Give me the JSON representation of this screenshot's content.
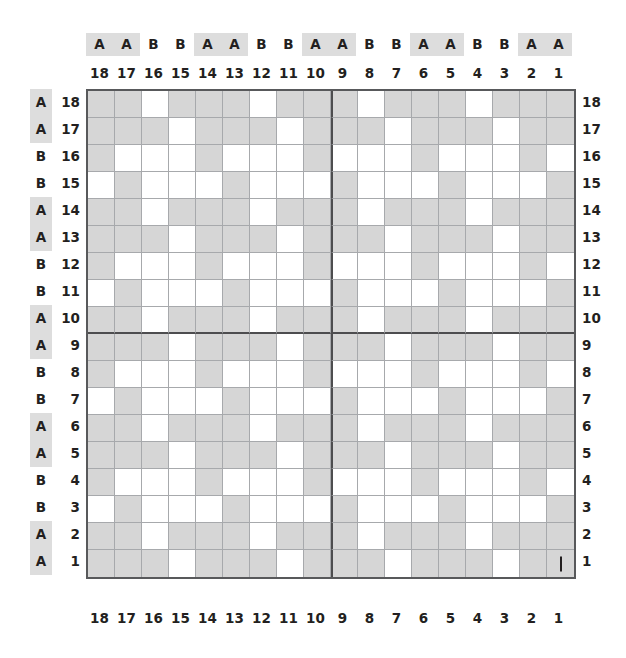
{
  "legend": {
    "shade_color": "#d6d6d6",
    "empty_color": "#ffffff",
    "highlight_color": "#dddddd",
    "grid_line_color": "#a7a9ac",
    "repeat_line_color": "#4d4d4f"
  },
  "chart_data": {
    "type": "heatmap",
    "title": "",
    "subtitle": "",
    "xlabel": "",
    "ylabel": "",
    "grid": true,
    "legend_position": "none",
    "rows": 18,
    "cols": 18,
    "x_tick_labels_top": [
      "18",
      "17",
      "16",
      "15",
      "14",
      "13",
      "12",
      "11",
      "10",
      "9",
      "8",
      "7",
      "6",
      "5",
      "4",
      "3",
      "2",
      "1"
    ],
    "x_tick_labels_bottom": [
      "18",
      "17",
      "16",
      "15",
      "14",
      "13",
      "12",
      "11",
      "10",
      "9",
      "8",
      "7",
      "6",
      "5",
      "4",
      "3",
      "2",
      "1"
    ],
    "x_group_labels": [
      "A",
      "A",
      "B",
      "B",
      "A",
      "A",
      "B",
      "B",
      "A",
      "A",
      "B",
      "B",
      "A",
      "A",
      "B",
      "B",
      "A",
      "A"
    ],
    "y_tick_labels_left": [
      "18",
      "17",
      "16",
      "15",
      "14",
      "13",
      "12",
      "11",
      "10",
      "9",
      "8",
      "7",
      "6",
      "5",
      "4",
      "3",
      "2",
      "1"
    ],
    "y_tick_labels_right": [
      "18",
      "17",
      "16",
      "15",
      "14",
      "13",
      "12",
      "11",
      "10",
      "9",
      "8",
      "7",
      "6",
      "5",
      "4",
      "3",
      "2",
      "1"
    ],
    "y_group_labels": [
      "A",
      "A",
      "B",
      "B",
      "A",
      "A",
      "B",
      "B",
      "A",
      "A",
      "B",
      "B",
      "A",
      "A",
      "B",
      "B",
      "A",
      "A"
    ],
    "repeat_divider_after_col_index": 8,
    "repeat_divider_after_row_index": 8,
    "annotations": [
      {
        "row_label": "1",
        "col_label": "1",
        "symbol": "|",
        "name": "stitch-tick-mark"
      }
    ],
    "values": [
      [
        1,
        1,
        0,
        1,
        1,
        1,
        0,
        1,
        1,
        1,
        0,
        1,
        1,
        1,
        0,
        1,
        1,
        1
      ],
      [
        1,
        1,
        1,
        0,
        1,
        1,
        1,
        0,
        1,
        1,
        1,
        0,
        1,
        1,
        1,
        0,
        1,
        1
      ],
      [
        1,
        0,
        0,
        0,
        1,
        0,
        0,
        0,
        1,
        0,
        0,
        0,
        1,
        0,
        0,
        0,
        1,
        0
      ],
      [
        0,
        1,
        0,
        0,
        0,
        1,
        0,
        0,
        0,
        1,
        0,
        0,
        0,
        1,
        0,
        0,
        0,
        1
      ],
      [
        1,
        1,
        0,
        1,
        1,
        1,
        0,
        1,
        1,
        1,
        0,
        1,
        1,
        1,
        0,
        1,
        1,
        1
      ],
      [
        1,
        1,
        1,
        0,
        1,
        1,
        1,
        0,
        1,
        1,
        1,
        0,
        1,
        1,
        1,
        0,
        1,
        1
      ],
      [
        1,
        0,
        0,
        0,
        1,
        0,
        0,
        0,
        1,
        0,
        0,
        0,
        1,
        0,
        0,
        0,
        1,
        0
      ],
      [
        0,
        1,
        0,
        0,
        0,
        1,
        0,
        0,
        0,
        1,
        0,
        0,
        0,
        1,
        0,
        0,
        0,
        1
      ],
      [
        1,
        1,
        0,
        1,
        1,
        1,
        0,
        1,
        1,
        1,
        0,
        1,
        1,
        1,
        0,
        1,
        1,
        1
      ],
      [
        1,
        1,
        1,
        0,
        1,
        1,
        1,
        0,
        1,
        1,
        1,
        0,
        1,
        1,
        1,
        0,
        1,
        1
      ],
      [
        1,
        0,
        0,
        0,
        1,
        0,
        0,
        0,
        1,
        0,
        0,
        0,
        1,
        0,
        0,
        0,
        1,
        0
      ],
      [
        0,
        1,
        0,
        0,
        0,
        1,
        0,
        0,
        0,
        1,
        0,
        0,
        0,
        1,
        0,
        0,
        0,
        1
      ],
      [
        1,
        1,
        0,
        1,
        1,
        1,
        0,
        1,
        1,
        1,
        0,
        1,
        1,
        1,
        0,
        1,
        1,
        1
      ],
      [
        1,
        1,
        1,
        0,
        1,
        1,
        1,
        0,
        1,
        1,
        1,
        0,
        1,
        1,
        1,
        0,
        1,
        1
      ],
      [
        1,
        0,
        0,
        0,
        1,
        0,
        0,
        0,
        1,
        0,
        0,
        0,
        1,
        0,
        0,
        0,
        1,
        0
      ],
      [
        0,
        1,
        0,
        0,
        0,
        1,
        0,
        0,
        0,
        1,
        0,
        0,
        0,
        1,
        0,
        0,
        0,
        1
      ],
      [
        1,
        1,
        0,
        1,
        1,
        1,
        0,
        1,
        1,
        1,
        0,
        1,
        1,
        1,
        0,
        1,
        1,
        1
      ],
      [
        1,
        1,
        1,
        0,
        1,
        1,
        1,
        0,
        1,
        1,
        1,
        0,
        1,
        1,
        1,
        0,
        1,
        1
      ]
    ]
  }
}
